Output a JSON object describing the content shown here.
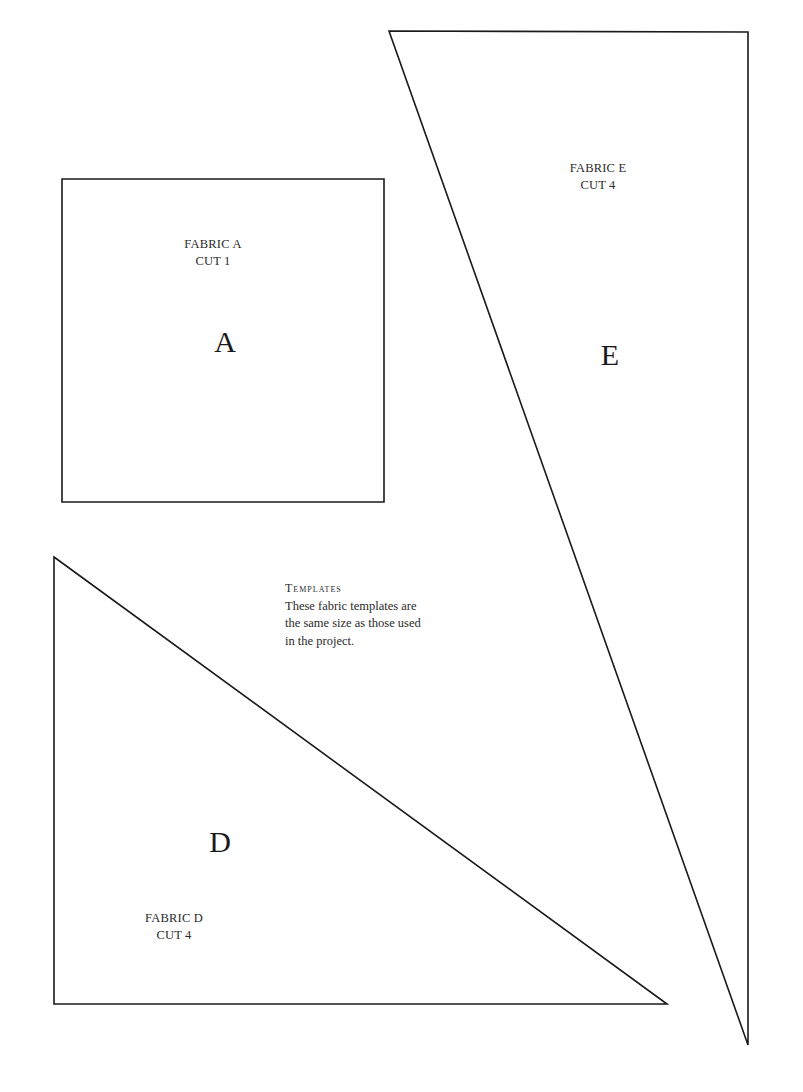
{
  "templates": {
    "fabric_a": {
      "shape": "square",
      "points": [
        [
          62,
          179
        ],
        [
          384,
          179
        ],
        [
          384,
          502
        ],
        [
          62,
          502
        ]
      ],
      "fabric_label": "FABRIC A",
      "cut_label": "CUT 1",
      "letter": "A"
    },
    "fabric_d": {
      "shape": "right-triangle",
      "points": [
        [
          54,
          557
        ],
        [
          667,
          1004
        ],
        [
          54,
          1004
        ]
      ],
      "fabric_label": "FABRIC D",
      "cut_label": "CUT 4",
      "letter": "D"
    },
    "fabric_e": {
      "shape": "long-triangle",
      "points": [
        [
          389,
          31
        ],
        [
          748,
          32
        ],
        [
          748,
          1045
        ]
      ],
      "fabric_label": "FABRIC E",
      "cut_label": "CUT 4",
      "letter": "E"
    }
  },
  "note": {
    "heading": "Templates",
    "line1": "These fabric templates are",
    "line2": "the same size as those used",
    "line3": "in the project."
  },
  "colors": {
    "stroke": "#1a1a1a",
    "background": "#ffffff"
  }
}
